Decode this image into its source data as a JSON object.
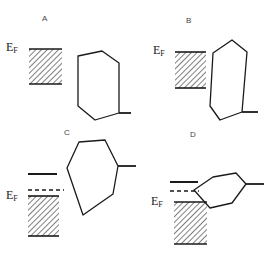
{
  "figure": {
    "title": "",
    "background_color": "#ffffff",
    "stroke_color": "#1a1a1a",
    "hatch_color": "#3a3a3a",
    "width": 268,
    "height": 256
  },
  "panels": [
    {
      "id": "A",
      "label": "A",
      "label_x": 42,
      "label_y": 14,
      "fermi_label": "E",
      "fermi_subscript": "F",
      "fermi_label_x": 6,
      "fermi_label_y": 45,
      "fermi_box": {
        "x": 29,
        "y": 49,
        "width": 33,
        "height": 35
      },
      "band_shape": "hexagon-tilted-tall",
      "band_polygon": "78,56 102,51 119,63 119,113 95,120 78,106",
      "stub_line": {
        "x1": 119,
        "y1": 113,
        "x2": 131,
        "y2": 113
      },
      "has_donor_level": false,
      "has_dashed_level": false
    },
    {
      "id": "B",
      "label": "B",
      "label_x": 186,
      "label_y": 16,
      "fermi_label": "E",
      "fermi_subscript": "F",
      "fermi_label_x": 153,
      "fermi_label_y": 47,
      "fermi_box": {
        "x": 175,
        "y": 52,
        "width": 31,
        "height": 36
      },
      "band_shape": "hexagon-narrow-tilted",
      "band_polygon": "213,53 232,40 247,52 242,112 220,120 210,106",
      "stub_line": {
        "x1": 242,
        "y1": 112,
        "x2": 258,
        "y2": 112
      },
      "has_donor_level": false,
      "has_dashed_level": false
    },
    {
      "id": "C",
      "label": "C",
      "label_x": 64,
      "label_y": 128,
      "fermi_label": "E",
      "fermi_subscript": "F",
      "fermi_label_x": 8,
      "fermi_label_y": 192,
      "fermi_box": {
        "x": 28,
        "y": 196,
        "width": 31,
        "height": 40
      },
      "band_shape": "hexagon-large",
      "band_polygon": "67,168 79,142 105,140 118,166 113,194 83,215",
      "stub_line": {
        "x1": 118,
        "y1": 166,
        "x2": 136,
        "y2": 166
      },
      "has_donor_level": true,
      "donor_line": {
        "x1": 28,
        "y1": 174,
        "x2": 57,
        "y2": 174
      },
      "has_dashed_level": true,
      "dashed_line": {
        "x1": 28,
        "y1": 190,
        "x2": 64,
        "y2": 190
      }
    },
    {
      "id": "D",
      "label": "D",
      "label_x": 190,
      "label_y": 130,
      "fermi_label": "E",
      "fermi_subscript": "F",
      "fermi_label_x": 152,
      "fermi_label_y": 198,
      "fermi_box": {
        "x": 174,
        "y": 202,
        "width": 33,
        "height": 42
      },
      "band_shape": "hexagon-small-tilted",
      "band_polygon": "194,190 213,177 236,173 246,184 232,203 210,208",
      "stub_line": {
        "x1": 246,
        "y1": 184,
        "x2": 264,
        "y2": 184
      },
      "has_donor_level": true,
      "donor_line": {
        "x1": 170,
        "y1": 182,
        "x2": 198,
        "y2": 182
      },
      "has_dashed_level": true,
      "dashed_line": {
        "x1": 170,
        "y1": 191,
        "x2": 199,
        "y2": 191
      }
    }
  ],
  "legend": {
    "fermi_level_meaning": "E_F",
    "hatched_region_meaning": "filled-metal-states",
    "polygon_meaning": "molecular-orbital-band",
    "dashed_meaning": "dashed-level",
    "solid_meaning": "solid-level"
  }
}
